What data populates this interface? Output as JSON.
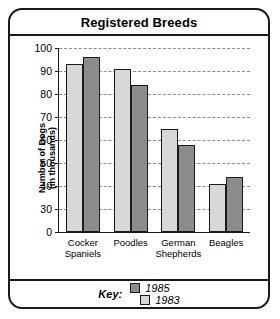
{
  "chart_data": {
    "type": "bar",
    "title": "Registered Breeds",
    "xlabel": "",
    "ylabel": "Number of Dogs (in thousands)",
    "ylabel_line1": "Number of Dogs",
    "ylabel_line2": "(in thousands)",
    "categories": [
      "Cocker Spaniels",
      "Poodles",
      "German Shepherds",
      "Beagles"
    ],
    "category_lines": [
      [
        "Cocker",
        "Spaniels"
      ],
      [
        "Poodles",
        ""
      ],
      [
        "German",
        "Shepherds"
      ],
      [
        "Beagles",
        ""
      ]
    ],
    "series": [
      {
        "name": "1983",
        "color": "#d8d8d8",
        "values": [
          93,
          91,
          65,
          41
        ]
      },
      {
        "name": "1985",
        "color": "#8c8c8c",
        "values": [
          96,
          84,
          58,
          44
        ]
      }
    ],
    "yticks": [
      100,
      90,
      80,
      70,
      60,
      50,
      40,
      30,
      0
    ],
    "ylim": [
      0,
      100
    ],
    "axis_break": true,
    "grid": true,
    "legend_position": "bottom",
    "legend_title": "Key:",
    "legend_entries": [
      {
        "label": "1985",
        "color": "#8c8c8c"
      },
      {
        "label": "1983",
        "color": "#d8d8d8"
      }
    ]
  }
}
